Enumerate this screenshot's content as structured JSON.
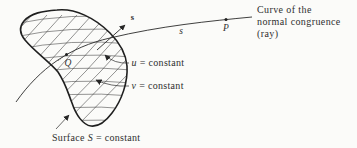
{
  "figure": {
    "caption": {
      "line1": "Curve of the",
      "line2": "normal congruence",
      "line3": "(ray)"
    },
    "labels": {
      "arc_length": "s",
      "point_P": "P",
      "point_Q": "Q",
      "vector_s": "s",
      "u_coordinate": "u",
      "u_suffix": "= constant",
      "v_coordinate": "v",
      "v_suffix": "= constant",
      "surface_word": "Surface",
      "surface_symbol": "S",
      "surface_suffix": "= constant"
    },
    "colors": {
      "ink": "#2f2f2f",
      "line": "#262626",
      "background": "#fbfbf9"
    }
  }
}
